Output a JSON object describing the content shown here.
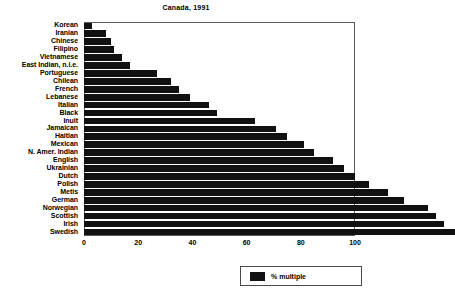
{
  "chart_data": {
    "type": "bar",
    "orientation": "horizontal",
    "title": "Canada, 1991",
    "xlabel": "",
    "ylabel": "",
    "xlim": [
      0,
      100
    ],
    "xticks": [
      0,
      20,
      40,
      60,
      80,
      100
    ],
    "grid": false,
    "legend": {
      "position": "bottom-right",
      "entries": [
        {
          "label": "% multiple",
          "color": "#111111"
        }
      ]
    },
    "series_name": "% multiple",
    "bar_color": "#111111",
    "categories": [
      "Korean",
      "Iranian",
      "Chinese",
      "Filipino",
      "Vietnamese",
      "East Indian, n.i.e.",
      "Portuguese",
      "Chilean",
      "French",
      "Lebanese",
      "Italian",
      "Black",
      "Inuit",
      "Jamaican",
      "Haitian",
      "Mexican",
      "N. Amer. Indian",
      "English",
      "Ukrainian",
      "Dutch",
      "Polish",
      "Metis",
      "German",
      "Norwegian",
      "Scottish",
      "Irish",
      "Swedish"
    ],
    "values": [
      3,
      8,
      10,
      11,
      14,
      17,
      27,
      32,
      35,
      39,
      46,
      49,
      63,
      71,
      75,
      81,
      85,
      92,
      96,
      100,
      105,
      112,
      118,
      127,
      130,
      133,
      137
    ]
  },
  "axis": {
    "tick_labels": [
      "0",
      "20",
      "40",
      "60",
      "80",
      "100"
    ]
  }
}
